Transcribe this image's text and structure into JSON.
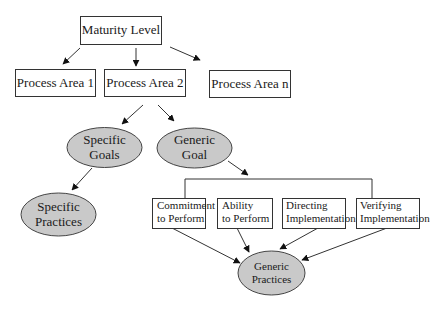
{
  "diagram": {
    "colors": {
      "line": "#333333",
      "box_fill": "#ffffff",
      "oval_fill": "#c9c9c9",
      "oval_stroke": "#444444"
    },
    "nodes": {
      "maturity_level": {
        "label": "Maturity Level",
        "shape": "rectangle"
      },
      "process_area_1": {
        "label": "Process Area 1",
        "shape": "rectangle"
      },
      "process_area_2": {
        "label": "Process Area 2",
        "shape": "rectangle"
      },
      "process_area_n": {
        "label": "Process Area n",
        "shape": "rectangle"
      },
      "specific_goals": {
        "line1": "Specific",
        "line2": "Goals",
        "shape": "ellipse"
      },
      "generic_goal": {
        "line1": "Generic",
        "line2": "Goal",
        "shape": "ellipse"
      },
      "specific_practices": {
        "line1": "Specific",
        "line2": "Practices",
        "shape": "ellipse"
      },
      "commitment": {
        "line1": "Commitment",
        "line2": "to Perform",
        "shape": "rectangle"
      },
      "ability": {
        "line1": "Ability",
        "line2": "to Perform",
        "shape": "rectangle"
      },
      "directing": {
        "line1": "Directing",
        "line2": "Implementation",
        "shape": "rectangle"
      },
      "verifying": {
        "line1": "Verifying",
        "line2": "Implementation",
        "shape": "rectangle"
      },
      "generic_practices": {
        "line1": "Generic",
        "line2": "Practices",
        "shape": "ellipse"
      }
    },
    "edges": [
      {
        "from": "maturity_level",
        "to": "process_area_1"
      },
      {
        "from": "maturity_level",
        "to": "process_area_2"
      },
      {
        "from": "maturity_level",
        "to": "process_area_n"
      },
      {
        "from": "process_area_2",
        "to": "specific_goals"
      },
      {
        "from": "process_area_2",
        "to": "generic_goal"
      },
      {
        "from": "specific_goals",
        "to": "specific_practices"
      },
      {
        "from": "generic_goal",
        "to": "common_features_group"
      },
      {
        "from": "commitment",
        "to": "generic_practices"
      },
      {
        "from": "ability",
        "to": "generic_practices"
      },
      {
        "from": "directing",
        "to": "generic_practices"
      },
      {
        "from": "verifying",
        "to": "generic_practices"
      }
    ]
  }
}
